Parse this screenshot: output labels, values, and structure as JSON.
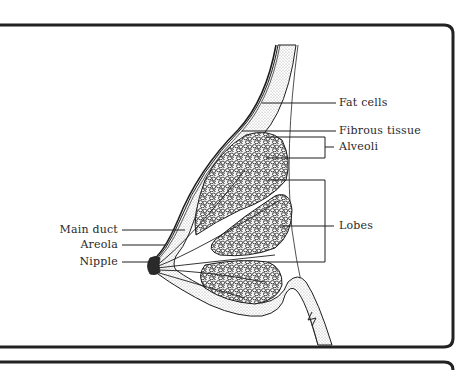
{
  "diagram": {
    "colors": {
      "ink": "#1e1e1e",
      "frame": "#222222",
      "stipple": "#c8c8c8",
      "background": "#ffffff"
    },
    "labels_right": [
      {
        "id": "fat-cells",
        "text": "Fat cells"
      },
      {
        "id": "fibrous-tissue",
        "text": "Fibrous tissue"
      },
      {
        "id": "alveoli",
        "text": "Alveoli"
      },
      {
        "id": "lobes",
        "text": "Lobes"
      }
    ],
    "labels_left": [
      {
        "id": "main-duct",
        "text": "Main duct"
      },
      {
        "id": "areola",
        "text": "Areola"
      },
      {
        "id": "nipple",
        "text": "Nipple"
      }
    ]
  }
}
